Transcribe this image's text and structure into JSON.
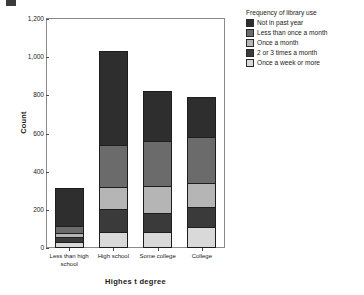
{
  "chart_data": {
    "type": "bar",
    "subtype": "stacked-bar",
    "title": "",
    "xlabel": "Highes t degree",
    "ylabel": "Count",
    "ylim": [
      0,
      1200
    ],
    "ytick_labels": [
      "0",
      "200",
      "400",
      "600",
      "800",
      "1,000",
      "1,200"
    ],
    "ytick_values": [
      0,
      200,
      400,
      600,
      800,
      1000,
      1200
    ],
    "grid": false,
    "legend_position": "right",
    "legend_title": "Frequency of library use",
    "categories": [
      "Less than high\nschool",
      "High school",
      "Some college",
      "College"
    ],
    "category_labels": [
      {
        "line1": "Less than high",
        "line2": "school"
      },
      {
        "line1": "High school",
        "line2": ""
      },
      {
        "line1": "Some college",
        "line2": ""
      },
      {
        "line1": "College",
        "line2": ""
      }
    ],
    "series": [
      {
        "name": "Once a week or more",
        "color": "#d9d9d9",
        "values": [
          30,
          82,
          82,
          112
        ]
      },
      {
        "name": "2 or 3 times a month",
        "color": "#3a3a3a",
        "values": [
          35,
          126,
          107,
          110
        ]
      },
      {
        "name": "Once a month",
        "color": "#b5b5b5",
        "values": [
          25,
          120,
          144,
          128
        ]
      },
      {
        "name": "Less than once a month",
        "color": "#6b6b6b",
        "values": [
          40,
          227,
          245,
          245
        ]
      },
      {
        "name": "Not in past year",
        "color": "#2e2e2e",
        "values": [
          205,
          500,
          267,
          215
        ]
      }
    ],
    "totals": [
      335,
      1055,
      845,
      810
    ],
    "stack_order_bottom_to_top": [
      "Once a week or more",
      "2 or 3 times a month",
      "Once a month",
      "Less than once a month",
      "Not in past year"
    ]
  },
  "legend": {
    "title": "Frequency of library use",
    "items": [
      {
        "label": "Not in past year",
        "color": "#2e2e2e"
      },
      {
        "label": "Less than once a month",
        "color": "#6b6b6b"
      },
      {
        "label": "Once a month",
        "color": "#b5b5b5"
      },
      {
        "label": "2 or 3 times a month",
        "color": "#3a3a3a"
      },
      {
        "label": "Once a week or more",
        "color": "#d9d9d9"
      }
    ]
  },
  "axes": {
    "y_title": "Count",
    "x_title": "Highes t degree"
  }
}
